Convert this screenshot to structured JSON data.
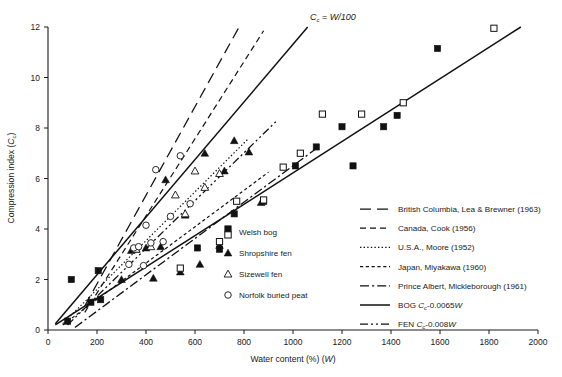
{
  "chart_data": {
    "type": "scatter",
    "title": "",
    "xlabel": "Water content (%) (W)",
    "ylabel": "Compression index (Cc)",
    "xlim": [
      0,
      2000
    ],
    "ylim": [
      0,
      12
    ],
    "xticks": [
      0,
      200,
      400,
      600,
      800,
      1000,
      1200,
      1400,
      1600,
      1800,
      2000
    ],
    "yticks": [
      0,
      2,
      4,
      6,
      8,
      10,
      12
    ],
    "grid": false,
    "legend_position": "inside-right",
    "annotations": [
      {
        "text": "Cc = W/100",
        "x": 1100,
        "y": 12.2
      }
    ],
    "series": [
      {
        "name": "Welsh bog",
        "marker": "filled-square",
        "points": [
          [
            80,
            0.35
          ],
          [
            95,
            2.0
          ],
          [
            175,
            1.1
          ],
          [
            205,
            2.35
          ],
          [
            215,
            1.2
          ],
          [
            610,
            3.25
          ],
          [
            700,
            3.2
          ],
          [
            760,
            4.6
          ],
          [
            880,
            5.1
          ],
          [
            1010,
            6.5
          ],
          [
            1095,
            7.25
          ],
          [
            1200,
            8.05
          ],
          [
            1245,
            6.5
          ],
          [
            1370,
            8.05
          ],
          [
            1425,
            8.5
          ],
          [
            1590,
            11.15
          ]
        ]
      },
      {
        "name": "Shropshire fen",
        "marker": "filled-triangle",
        "points": [
          [
            300,
            2.0
          ],
          [
            340,
            3.15
          ],
          [
            360,
            3.2
          ],
          [
            400,
            3.25
          ],
          [
            430,
            2.05
          ],
          [
            460,
            3.3
          ],
          [
            480,
            5.95
          ],
          [
            540,
            2.3
          ],
          [
            560,
            4.55
          ],
          [
            620,
            2.6
          ],
          [
            640,
            7.0
          ],
          [
            700,
            3.35
          ],
          [
            720,
            6.3
          ],
          [
            760,
            7.5
          ],
          [
            820,
            7.05
          ],
          [
            870,
            5.05
          ]
        ]
      },
      {
        "name": "Sizewell fen",
        "marker": "open-triangle",
        "points": [
          [
            360,
            3.2
          ],
          [
            420,
            3.3
          ],
          [
            520,
            5.35
          ],
          [
            560,
            4.6
          ],
          [
            600,
            6.3
          ],
          [
            640,
            5.65
          ],
          [
            700,
            6.2
          ]
        ]
      },
      {
        "name": "Norfolk buried peat",
        "marker": "open-circle",
        "points": [
          [
            330,
            2.6
          ],
          [
            350,
            3.25
          ],
          [
            370,
            3.3
          ],
          [
            390,
            2.55
          ],
          [
            400,
            4.15
          ],
          [
            420,
            3.45
          ],
          [
            440,
            6.35
          ],
          [
            470,
            3.5
          ],
          [
            500,
            4.5
          ],
          [
            540,
            6.9
          ],
          [
            580,
            5.0
          ]
        ]
      },
      {
        "name": "Welsh bog (open)",
        "marker": "open-square",
        "points": [
          [
            540,
            2.45
          ],
          [
            700,
            3.5
          ],
          [
            770,
            5.1
          ],
          [
            880,
            5.15
          ],
          [
            960,
            6.45
          ],
          [
            1030,
            7.0
          ],
          [
            1120,
            8.55
          ],
          [
            1280,
            8.55
          ],
          [
            1450,
            9.0
          ],
          [
            1820,
            11.95
          ]
        ]
      }
    ],
    "fit_lines": [
      {
        "name": "British Columbia, Lea & Brewner (1963)",
        "style": "long-dash",
        "x0": 150,
        "y0": 0.95,
        "x1": 780,
        "y1": 12.0
      },
      {
        "name": "Canada, Cook (1956)",
        "style": "dash",
        "x0": 150,
        "y0": 0.7,
        "x1": 880,
        "y1": 11.85
      },
      {
        "name": "U.S.A., Moore (1952)",
        "style": "dotted",
        "x0": 60,
        "y0": 0.25,
        "x1": 820,
        "y1": 7.6
      },
      {
        "name": "Japan, Miyakawa (1960)",
        "style": "short-dash",
        "x0": 60,
        "y0": 0.2,
        "x1": 900,
        "y1": 6.25
      },
      {
        "name": "Prince Albert, Mickleborough (1961)",
        "style": "dash-dot",
        "x0": 110,
        "y0": 0.1,
        "x1": 1090,
        "y1": 7.15
      },
      {
        "name": "BOG Cc=0.0065W",
        "style": "solid",
        "x0": 30,
        "y0": 0.2,
        "x1": 1930,
        "y1": 12.0
      },
      {
        "name": "FEN Cc=0.008W",
        "style": "dash-dot-dot",
        "x0": 80,
        "y0": 0.2,
        "x1": 930,
        "y1": 8.25
      },
      {
        "name": "Cc = W/100 reference",
        "style": "solid-thin",
        "x0": 30,
        "y0": 0.25,
        "x1": 1060,
        "y1": 12.0
      }
    ]
  },
  "axes": {
    "x_label": "Water content (%) (",
    "x_label_var": "W",
    "x_label_end": ")",
    "y_label_main": "Compression index (",
    "y_label_var": "C",
    "y_label_sub": "c",
    "y_label_end": ")",
    "x_tick_labels": [
      "0",
      "200",
      "400",
      "600",
      "800",
      "1000",
      "1200",
      "1400",
      "1600",
      "1800",
      "2000"
    ],
    "y_tick_labels": [
      "0",
      "2",
      "4",
      "6",
      "8",
      "10",
      "12"
    ]
  },
  "annotation": {
    "var1": "C",
    "sub1": "c",
    "eq": " = ",
    "expr": "W/100"
  },
  "marker_legend": {
    "items": [
      {
        "id": "welsh-bog",
        "label": "Welsh bog",
        "marker": "split-square"
      },
      {
        "id": "shropshire-fen",
        "label": "Shropshire fen",
        "marker": "filled-triangle"
      },
      {
        "id": "sizewell-fen",
        "label": "Sizewell fen",
        "marker": "open-triangle"
      },
      {
        "id": "norfolk-buried-peat",
        "label": "Norfolk buried peat",
        "marker": "open-circle"
      }
    ]
  },
  "line_legend": {
    "items": [
      {
        "id": "british-columbia",
        "label": "British Columbia, Lea & Brewner (1963)",
        "style": "long-dash"
      },
      {
        "id": "canada-cook",
        "label": "Canada, Cook (1956)",
        "style": "dash"
      },
      {
        "id": "usa-moore",
        "label": "U.S.A., Moore (1952)",
        "style": "dotted"
      },
      {
        "id": "japan-miyakawa",
        "label": "Japan, Miyakawa (1960)",
        "style": "short-dash"
      },
      {
        "id": "prince-albert",
        "label": "Prince Albert, Mickleborough (1961)",
        "style": "dash-dot"
      },
      {
        "id": "bog-equation",
        "label": "BOG ",
        "style": "solid",
        "var": "C",
        "sub": "c",
        "tail": "-0.0065",
        "tailvar": "W"
      },
      {
        "id": "fen-equation",
        "label": "FEN ",
        "style": "dash-dot-dot",
        "var": "C",
        "sub": "c",
        "tail": "-0.008",
        "tailvar": "W"
      }
    ]
  }
}
